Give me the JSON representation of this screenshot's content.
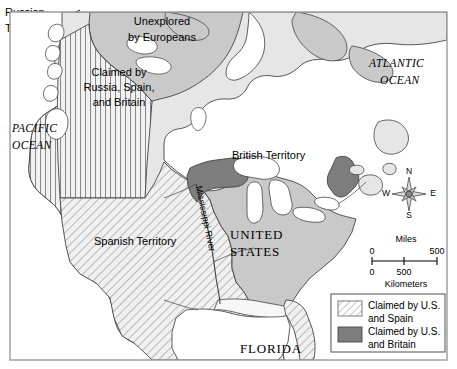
{
  "figure": {
    "kind": "historical-map",
    "frame": {
      "stroke": "#9a9a9a",
      "fill": "#ffffff"
    }
  },
  "colors": {
    "land_light": "#e6e6e6",
    "land_medium": "#c9c9c9",
    "land_dark": "#7d7d7d",
    "water": "#ffffff",
    "outline": "#444444",
    "text": "#000000",
    "frame": "#9a9a9a",
    "hatch_diagonal": "#8a8a8a",
    "hatch_vertical": "#8a8a8a"
  },
  "labels": {
    "russian_territory": "Russian\nTerritory",
    "russian_territory_line1": "Russian",
    "russian_territory_line2": "Territory",
    "unexplored_line1": "Unexplored",
    "unexplored_line2": "by Europeans",
    "claimed_rsb_line1": "Claimed by",
    "claimed_rsb_line2": "Russia, Spain,",
    "claimed_rsb_line3": "and Britain",
    "pacific_ocean_line1": "PACIFIC",
    "pacific_ocean_line2": "OCEAN",
    "atlantic_ocean_line1": "ATLANTIC",
    "atlantic_ocean_line2": "OCEAN",
    "british_territory": "British Territory",
    "spanish_territory": "Spanish Territory",
    "united_states_line1": "UNITED",
    "united_states_line2": "STATES",
    "mississippi_river": "Mississippi River",
    "florida": "FLORIDA"
  },
  "compass": {
    "north": "N",
    "east": "E",
    "south": "S",
    "west": "W"
  },
  "scale": {
    "miles_title": "Miles",
    "miles_start": "0",
    "miles_end": "500",
    "kilometers_title": "Kilometers",
    "km_start": "0",
    "km_mid": "500"
  },
  "legend": {
    "items": [
      {
        "swatch": "diagonal-hatch",
        "line1": "Claimed by U.S.",
        "line2": "and Spain"
      },
      {
        "swatch": "solid-dark",
        "line1": "Claimed by U.S.",
        "line2": "and Britain"
      }
    ]
  }
}
